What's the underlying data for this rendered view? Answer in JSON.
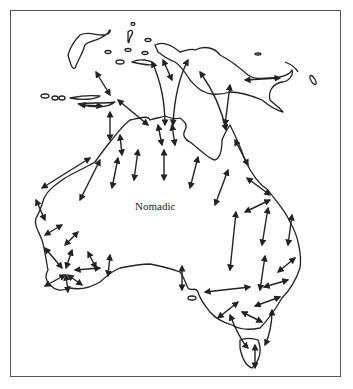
{
  "map": {
    "label": "Nomadic",
    "label_pos": {
      "x": 135,
      "y": 207
    },
    "frame": {
      "x": 10,
      "y": 10,
      "w": 331,
      "h": 367
    },
    "colors": {
      "line": "#222222",
      "frame": "#555555",
      "background": "#ffffff"
    },
    "regions": [
      "Australia",
      "New Guinea",
      "Tasmania",
      "Sulawesi",
      "Lesser Sunda Islands"
    ]
  }
}
